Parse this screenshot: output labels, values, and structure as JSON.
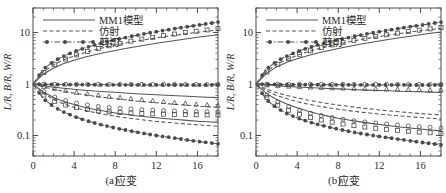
{
  "figure": {
    "panels": [
      {
        "caption": "(a)",
        "xlabel": "应变",
        "ylabel": "L/R, B/R, W/R",
        "xticks": [
          0,
          4,
          8,
          12,
          16
        ],
        "yticks": [
          "10",
          "1",
          "0.1"
        ]
      },
      {
        "caption": "(b)",
        "xlabel": "应变",
        "ylabel": "L/R, B/R, W/R",
        "xticks": [
          0,
          4,
          8,
          12,
          16
        ],
        "yticks": [
          "10",
          "1",
          "0.1"
        ]
      }
    ],
    "legend": {
      "items": [
        {
          "label": "MM1模型",
          "style": "solid",
          "marker": "none"
        },
        {
          "label": "仿射",
          "style": "dashed",
          "marker": "none"
        },
        {
          "label": "剪切",
          "style": "dashdot",
          "marker": "filled-circle"
        }
      ]
    },
    "colors": {
      "axis": "#4a4a4a",
      "curve": "#555555",
      "marker": "#4a4a4a",
      "text": "#2b2b2b",
      "background": "#ffffff"
    }
  },
  "chart_data": [
    {
      "type": "line",
      "title": "",
      "subtitle": "(a)",
      "xlabel": "应变",
      "ylabel": "L/R, B/R, W/R",
      "xlim": [
        0,
        18
      ],
      "ylim": [
        0.04,
        30
      ],
      "yscale": "log",
      "grid": false,
      "legend_position": "top-center",
      "xticks": [
        0,
        4,
        8,
        12,
        16
      ],
      "yticks": [
        0.1,
        1,
        10
      ],
      "x": [
        0,
        1,
        2,
        3,
        4,
        5,
        6,
        7,
        8,
        9,
        10,
        11,
        12,
        13,
        14,
        15,
        16,
        17,
        18
      ],
      "series": [
        {
          "name": "MM1模型 L/R",
          "style": "solid",
          "marker": "none",
          "values": [
            1.0,
            1.55,
            2.05,
            2.5,
            2.9,
            3.3,
            3.7,
            4.1,
            4.5,
            4.9,
            5.3,
            5.75,
            6.2,
            6.65,
            7.1,
            7.6,
            8.1,
            8.6,
            9.1
          ]
        },
        {
          "name": "MM1模型 B/R",
          "style": "solid",
          "marker": "none",
          "values": [
            1.0,
            0.93,
            0.87,
            0.83,
            0.79,
            0.76,
            0.73,
            0.71,
            0.69,
            0.67,
            0.65,
            0.635,
            0.62,
            0.605,
            0.59,
            0.578,
            0.566,
            0.555,
            0.545
          ]
        },
        {
          "name": "MM1模型 W/R",
          "style": "solid",
          "marker": "none",
          "values": [
            1.0,
            0.7,
            0.55,
            0.46,
            0.4,
            0.355,
            0.32,
            0.295,
            0.275,
            0.258,
            0.243,
            0.231,
            0.221,
            0.212,
            0.204,
            0.197,
            0.19,
            0.185,
            0.18
          ]
        },
        {
          "name": "仿射 L/R",
          "style": "dashed",
          "marker": "none",
          "values": [
            1.0,
            1.72,
            2.35,
            2.95,
            3.5,
            4.05,
            4.6,
            5.15,
            5.7,
            6.25,
            6.8,
            7.35,
            7.9,
            8.45,
            9.0,
            9.55,
            10.1,
            10.65,
            11.2
          ]
        },
        {
          "name": "仿射 B/R",
          "style": "dashed",
          "marker": "none",
          "values": [
            1.0,
            0.88,
            0.79,
            0.72,
            0.665,
            0.62,
            0.58,
            0.55,
            0.52,
            0.495,
            0.47,
            0.45,
            0.432,
            0.415,
            0.4,
            0.387,
            0.375,
            0.363,
            0.353
          ]
        },
        {
          "name": "仿射 W/R",
          "style": "dashed",
          "marker": "none",
          "values": [
            1.0,
            0.66,
            0.5,
            0.41,
            0.35,
            0.31,
            0.28,
            0.256,
            0.237,
            0.222,
            0.209,
            0.198,
            0.188,
            0.18,
            0.173,
            0.167,
            0.161,
            0.156,
            0.151
          ]
        },
        {
          "name": "剪切 L/R",
          "style": "dashdot",
          "marker": "filled-circle",
          "values": [
            1.0,
            1.95,
            2.75,
            3.5,
            4.25,
            5.0,
            5.75,
            6.5,
            7.25,
            8.0,
            8.8,
            9.6,
            10.4,
            11.2,
            12.1,
            13.0,
            13.9,
            14.9,
            16.0
          ]
        },
        {
          "name": "剪切 B/R",
          "style": "dashdot",
          "marker": "filled-circle",
          "values": [
            1.0,
            0.985,
            0.98,
            0.975,
            0.972,
            0.97,
            0.968,
            0.966,
            0.965,
            0.964,
            0.963,
            0.962,
            0.961,
            0.96,
            0.96,
            0.959,
            0.958,
            0.958,
            0.957
          ]
        },
        {
          "name": "剪切 W/R",
          "style": "dashdot",
          "marker": "filled-circle",
          "values": [
            1.0,
            0.52,
            0.365,
            0.285,
            0.235,
            0.2,
            0.175,
            0.156,
            0.14,
            0.128,
            0.117,
            0.108,
            0.1,
            0.094,
            0.088,
            0.082,
            0.077,
            0.073,
            0.069
          ]
        },
        {
          "name": "仿真 L/R (open square)",
          "style": "none",
          "marker": "open-square",
          "values": [
            1.0,
            1.65,
            2.3,
            2.95,
            3.55,
            4.15,
            4.7,
            5.3,
            5.9,
            6.5,
            7.1,
            7.7,
            8.3,
            8.9,
            9.5,
            10.1,
            10.7,
            11.3,
            11.9
          ]
        },
        {
          "name": "仿真 B/R (open triangle)",
          "style": "none",
          "marker": "open-triangle",
          "values": [
            1.0,
            0.9,
            0.82,
            0.76,
            0.7,
            0.66,
            0.62,
            0.59,
            0.56,
            0.535,
            0.51,
            0.49,
            0.47,
            0.45,
            0.435,
            0.42,
            0.405,
            0.395,
            0.385
          ]
        },
        {
          "name": "仿真 W/R (open circle)",
          "style": "none",
          "marker": "open-circle",
          "values": [
            1.0,
            0.995,
            0.99,
            0.99,
            0.99,
            0.988,
            0.988,
            0.987,
            0.987,
            0.986,
            0.986,
            0.985,
            0.985,
            0.985,
            0.984,
            0.984,
            0.984,
            0.983,
            0.983
          ]
        },
        {
          "name": "仿真 W/R low (open square)",
          "style": "none",
          "marker": "open-square",
          "values": [
            1.0,
            0.62,
            0.47,
            0.4,
            0.355,
            0.325,
            0.305,
            0.292,
            0.282,
            0.275,
            0.27,
            0.266,
            0.262,
            0.259,
            0.257,
            0.255,
            0.253,
            0.251,
            0.25
          ]
        },
        {
          "name": "仿真 mid (open circle)",
          "style": "none",
          "marker": "open-circle",
          "values": [
            1.0,
            0.72,
            0.57,
            0.49,
            0.435,
            0.4,
            0.375,
            0.357,
            0.343,
            0.332,
            0.323,
            0.316,
            0.31,
            0.305,
            0.3,
            0.296,
            0.293,
            0.29,
            0.288
          ]
        }
      ]
    },
    {
      "type": "line",
      "title": "",
      "subtitle": "(b)",
      "xlabel": "应变",
      "ylabel": "L/R, B/R, W/R",
      "xlim": [
        0,
        18
      ],
      "ylim": [
        0.04,
        30
      ],
      "yscale": "log",
      "grid": false,
      "legend_position": "top-center",
      "xticks": [
        0,
        4,
        8,
        12,
        16
      ],
      "yticks": [
        0.1,
        1,
        10
      ],
      "x": [
        0,
        1,
        2,
        3,
        4,
        5,
        6,
        7,
        8,
        9,
        10,
        11,
        12,
        13,
        14,
        15,
        16,
        17,
        18
      ],
      "series": [
        {
          "name": "MM1模型 L/R",
          "style": "solid",
          "marker": "none",
          "values": [
            1.0,
            1.6,
            2.15,
            2.65,
            3.1,
            3.55,
            4.0,
            4.45,
            4.9,
            5.35,
            5.85,
            6.35,
            6.85,
            7.4,
            7.95,
            8.5,
            9.1,
            9.7,
            10.3
          ]
        },
        {
          "name": "MM1模型 B/R",
          "style": "solid",
          "marker": "none",
          "values": [
            1.0,
            0.965,
            0.93,
            0.9,
            0.875,
            0.855,
            0.835,
            0.82,
            0.805,
            0.79,
            0.775,
            0.762,
            0.75,
            0.738,
            0.727,
            0.716,
            0.706,
            0.697,
            0.688
          ]
        },
        {
          "name": "MM1模型 W/R",
          "style": "solid",
          "marker": "none",
          "values": [
            1.0,
            0.66,
            0.5,
            0.41,
            0.345,
            0.3,
            0.265,
            0.238,
            0.217,
            0.2,
            0.186,
            0.174,
            0.164,
            0.155,
            0.147,
            0.14,
            0.134,
            0.128,
            0.123
          ]
        },
        {
          "name": "仿射 L/R",
          "style": "dashed",
          "marker": "none",
          "values": [
            1.0,
            1.75,
            2.4,
            3.0,
            3.6,
            4.2,
            4.8,
            5.4,
            6.0,
            6.6,
            7.2,
            7.8,
            8.4,
            9.0,
            9.6,
            10.2,
            10.8,
            11.4,
            12.0
          ]
        },
        {
          "name": "仿射 B/R",
          "style": "dashed",
          "marker": "none",
          "values": [
            1.0,
            0.8,
            0.68,
            0.6,
            0.54,
            0.49,
            0.45,
            0.42,
            0.392,
            0.368,
            0.348,
            0.33,
            0.314,
            0.3,
            0.288,
            0.277,
            0.267,
            0.258,
            0.25
          ]
        },
        {
          "name": "仿射 W/R",
          "style": "dashed",
          "marker": "none",
          "values": [
            1.0,
            0.74,
            0.6,
            0.52,
            0.455,
            0.41,
            0.375,
            0.347,
            0.324,
            0.305,
            0.288,
            0.274,
            0.262,
            0.25,
            0.24,
            0.231,
            0.223,
            0.216,
            0.21
          ]
        },
        {
          "name": "剪切 L/R",
          "style": "dashdot",
          "marker": "filled-circle",
          "values": [
            1.0,
            1.95,
            2.75,
            3.5,
            4.25,
            5.0,
            5.75,
            6.5,
            7.25,
            8.0,
            8.8,
            9.6,
            10.4,
            11.2,
            12.1,
            13.0,
            13.9,
            14.9,
            16.0
          ]
        },
        {
          "name": "剪切 B/R",
          "style": "dashdot",
          "marker": "filled-circle",
          "values": [
            1.0,
            0.985,
            0.98,
            0.975,
            0.972,
            0.97,
            0.968,
            0.966,
            0.965,
            0.964,
            0.963,
            0.962,
            0.961,
            0.96,
            0.96,
            0.959,
            0.958,
            0.958,
            0.957
          ]
        },
        {
          "name": "剪切 W/R",
          "style": "dashdot",
          "marker": "filled-circle",
          "values": [
            1.0,
            0.5,
            0.345,
            0.268,
            0.22,
            0.188,
            0.165,
            0.147,
            0.133,
            0.121,
            0.111,
            0.103,
            0.096,
            0.09,
            0.084,
            0.079,
            0.074,
            0.07,
            0.066
          ]
        },
        {
          "name": "仿真 L/R (open square)",
          "style": "none",
          "marker": "open-square",
          "values": [
            1.0,
            1.68,
            2.35,
            3.0,
            3.65,
            4.25,
            4.85,
            5.5,
            6.1,
            6.7,
            7.35,
            8.0,
            8.6,
            9.25,
            9.9,
            10.55,
            11.2,
            11.85,
            12.5
          ]
        },
        {
          "name": "仿真 B/R (open triangle)",
          "style": "none",
          "marker": "open-triangle",
          "values": [
            1.0,
            0.96,
            0.93,
            0.91,
            0.89,
            0.875,
            0.86,
            0.85,
            0.84,
            0.83,
            0.82,
            0.812,
            0.805,
            0.798,
            0.79,
            0.784,
            0.778,
            0.772,
            0.767
          ]
        },
        {
          "name": "仿真 W/R (open circle)",
          "style": "none",
          "marker": "open-circle",
          "values": [
            1.0,
            0.995,
            0.992,
            0.99,
            0.99,
            0.989,
            0.988,
            0.988,
            0.987,
            0.987,
            0.986,
            0.986,
            0.985,
            0.985,
            0.985,
            0.984,
            0.984,
            0.984,
            0.983
          ]
        },
        {
          "name": "仿真 W/R low (open square)",
          "style": "none",
          "marker": "open-square",
          "values": [
            1.0,
            0.56,
            0.4,
            0.32,
            0.268,
            0.232,
            0.207,
            0.188,
            0.173,
            0.161,
            0.151,
            0.143,
            0.136,
            0.13,
            0.125,
            0.12,
            0.116,
            0.113,
            0.11
          ]
        },
        {
          "name": "仿真 mid (open circle)",
          "style": "none",
          "marker": "open-circle",
          "values": [
            1.0,
            0.62,
            0.46,
            0.375,
            0.32,
            0.28,
            0.252,
            0.231,
            0.214,
            0.2,
            0.189,
            0.18,
            0.172,
            0.165,
            0.159,
            0.153,
            0.148,
            0.144,
            0.14
          ]
        }
      ]
    }
  ]
}
